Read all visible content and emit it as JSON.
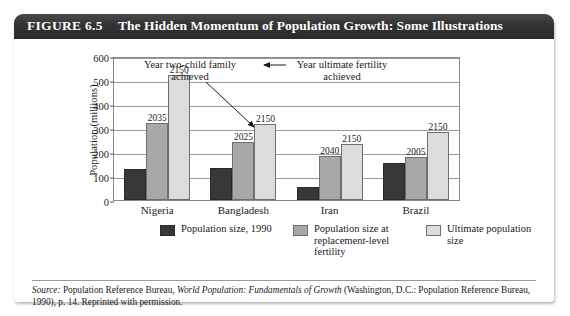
{
  "figure": {
    "number_label": "FIGURE 6.5",
    "title": "The Hidden Momentum of Population Growth: Some Illustrations"
  },
  "annotations": {
    "left": "Year two-child family achieved",
    "right": "Year ultimate fertility achieved"
  },
  "legend": [
    {
      "key": "c0",
      "label": "Population size, 1990",
      "color": "#383838"
    },
    {
      "key": "c1",
      "label": "Population size at replacement-level fertility",
      "color": "#a8a8a8"
    },
    {
      "key": "c2",
      "label": "Ultimate population size",
      "color": "#dcdcdc"
    }
  ],
  "source": {
    "prefix": "Source:",
    "line1_a": " Population Reference Bureau, ",
    "italic": "World Population: Fundamentals of Growth",
    "line1_b": " (Washington, D.C.: Population",
    "line2": "Reference Bureau, 1990), p. 14. Reprinted with permission."
  },
  "chart_data": {
    "type": "bar",
    "title": "The Hidden Momentum of Population Growth: Some Illustrations",
    "xlabel": "",
    "ylabel": "Population (millions)",
    "ylim": [
      0,
      600
    ],
    "yticks": [
      0,
      100,
      200,
      300,
      400,
      500,
      600
    ],
    "grid": true,
    "legend_position": "bottom",
    "categories": [
      "Nigeria",
      "Bangladesh",
      "Iran",
      "Brazil"
    ],
    "series": [
      {
        "name": "Population size, 1990",
        "color": "#383838",
        "values": [
          128,
          133,
          55,
          153
        ],
        "point_labels": [
          "",
          "",
          "",
          ""
        ]
      },
      {
        "name": "Population size at replacement-level fertility",
        "color": "#a8a8a8",
        "values": [
          320,
          240,
          185,
          180
        ],
        "point_labels": [
          "2035",
          "2025",
          "2040",
          "2005"
        ]
      },
      {
        "name": "Ultimate population size",
        "color": "#dcdcdc",
        "values": [
          520,
          316,
          233,
          285
        ],
        "point_labels": [
          "2150",
          "2150",
          "2150",
          "2150"
        ]
      }
    ]
  }
}
